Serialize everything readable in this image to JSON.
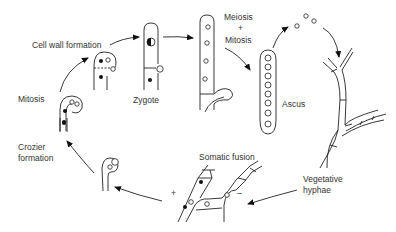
{
  "labels": {
    "cell_wall_formation": "Cell wall formation",
    "mitosis": "Mitosis",
    "zygote": "Zygote",
    "meiosis": "Meiosis",
    "plus": "+",
    "mitosis2": "Mitosis",
    "ascus": "Ascus",
    "crozier_formation_1": "Crozier",
    "crozier_formation_2": "formation",
    "somatic_fusion": "Somatic fusion",
    "vegetative_1": "Vegetative",
    "vegetative_2": "hyphae",
    "mating_plus": "+",
    "mating_minus": "–"
  },
  "stages": [
    "Vegetative hyphae",
    "Somatic fusion",
    "Crozier formation",
    "Mitosis",
    "Cell wall formation",
    "Zygote",
    "Meiosis + Mitosis",
    "Ascus"
  ]
}
